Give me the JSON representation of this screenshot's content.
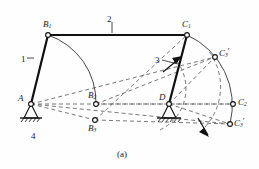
{
  "figure": {
    "caption": "(a)"
  },
  "link_numbers": [
    {
      "id": "link-1",
      "label": "1",
      "x": 21,
      "y": 55
    },
    {
      "id": "link-2",
      "label": "2",
      "x": 107,
      "y": 15
    },
    {
      "id": "link-3",
      "label": "3",
      "x": 155,
      "y": 56
    },
    {
      "id": "link-4",
      "label": "4",
      "x": 31,
      "y": 132
    }
  ],
  "points": [
    {
      "id": "A",
      "base": "A",
      "sub": "",
      "prime": false,
      "px": 31,
      "py": 104,
      "lx": 18,
      "ly": 94
    },
    {
      "id": "B1",
      "base": "B",
      "sub": "1",
      "prime": false,
      "px": 48,
      "py": 35,
      "lx": 43,
      "ly": 20
    },
    {
      "id": "B2",
      "base": "B",
      "sub": "2",
      "prime": false,
      "px": 96,
      "py": 104,
      "lx": 88,
      "ly": 91
    },
    {
      "id": "B3",
      "base": "B",
      "sub": "3",
      "prime": false,
      "px": 95,
      "py": 120,
      "lx": 88,
      "ly": 124
    },
    {
      "id": "C1",
      "base": "C",
      "sub": "1",
      "prime": false,
      "px": 187,
      "py": 35,
      "lx": 182,
      "ly": 20
    },
    {
      "id": "C2",
      "base": "C",
      "sub": "2",
      "prime": false,
      "px": 233,
      "py": 104,
      "lx": 238,
      "ly": 98
    },
    {
      "id": "C3p",
      "base": "C",
      "sub": "3",
      "prime": true,
      "px": 215,
      "py": 57,
      "lx": 219,
      "ly": 48
    },
    {
      "id": "C3",
      "base": "C",
      "sub": "3",
      "prime": true,
      "px": 230,
      "py": 124,
      "lx": 234,
      "ly": 118
    },
    {
      "id": "D",
      "base": "D",
      "sub": "",
      "prime": false,
      "px": 169,
      "py": 104,
      "lx": 159,
      "ly": 93
    }
  ],
  "colors": {
    "stroke": "#1a1a1a",
    "thin": "#444444",
    "dash": "#555555",
    "background": "#fefefe"
  }
}
